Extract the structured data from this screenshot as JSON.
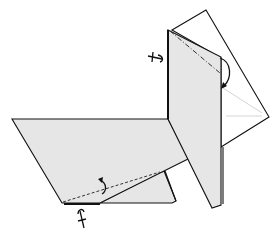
{
  "diagram": {
    "title": "",
    "type": "origami-fold-step",
    "colors": {
      "paper_colored": "#e6e6e6",
      "paper_white": "#ffffff",
      "line": "#111111",
      "faint_crease": "#cfcfcf"
    },
    "elements": [
      {
        "name": "back-square-flap",
        "kind": "white-panel"
      },
      {
        "name": "vertical-panel",
        "kind": "colored-panel"
      },
      {
        "name": "left-parallelogram-flap",
        "kind": "colored-panel"
      },
      {
        "name": "lower-small-flap",
        "kind": "colored-panel"
      },
      {
        "name": "mountain-fold-line-upper",
        "kind": "mountain-fold"
      },
      {
        "name": "valley-fold-line-lower",
        "kind": "valley-fold"
      },
      {
        "name": "fold-behind-arrow-upper",
        "kind": "arrow"
      },
      {
        "name": "fold-behind-arrow-lower",
        "kind": "arrow"
      },
      {
        "name": "pivot-symbol-upper",
        "kind": "symbol"
      },
      {
        "name": "pivot-symbol-lower",
        "kind": "symbol"
      }
    ],
    "annotations": []
  }
}
